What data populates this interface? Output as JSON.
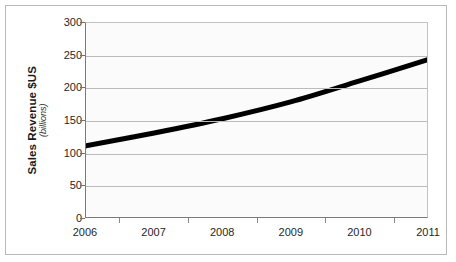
{
  "chart_data": {
    "type": "line",
    "title": "",
    "xlabel": "",
    "ylabel": "Sales Revenue $US",
    "ylabel_sub": "(billions)",
    "categories": [
      "2006",
      "2007",
      "2008",
      "2009",
      "2010",
      "2011"
    ],
    "x": [
      2006,
      2007,
      2008,
      2009,
      2010,
      2011
    ],
    "values": [
      110,
      130,
      152,
      178,
      210,
      243
    ],
    "series": [
      {
        "name": "Sales Revenue",
        "values": [
          110,
          130,
          152,
          178,
          210,
          243
        ],
        "color": "#000000",
        "line_width": 5,
        "smooth": true,
        "markers": false
      }
    ],
    "ylim": [
      0,
      300
    ],
    "y_ticks": [
      0,
      50,
      100,
      150,
      200,
      250,
      300
    ],
    "y_tick_labels": [
      "0",
      "50",
      "100",
      "150",
      "200",
      "250",
      "300"
    ],
    "xlim": [
      2006,
      2011
    ],
    "grid": "horizontal",
    "legend": "none",
    "plot_background": "#fbfbfb",
    "grid_color": "#bcbcbc",
    "axis_color": "#7a7a7a",
    "frame_color": "#b9b9b9",
    "text_color": "#1f1f1f"
  }
}
